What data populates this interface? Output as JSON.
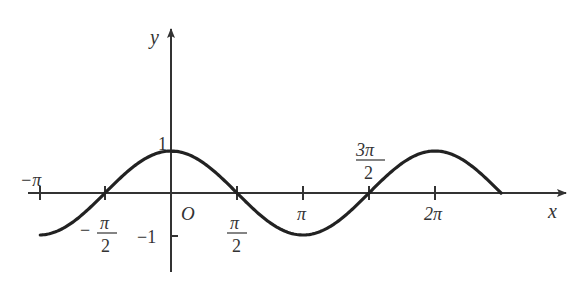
{
  "figure": {
    "axis_labels": {
      "x": "x",
      "y": "y",
      "origin": "O"
    },
    "y_ticks": [
      {
        "value": 1,
        "label": "1"
      },
      {
        "value": -1,
        "label": "−1"
      }
    ],
    "x_ticks": [
      {
        "value": "-pi",
        "label": "−π"
      },
      {
        "value": "-pi/2",
        "numerator": "π",
        "denominator": "2",
        "sign": "−"
      },
      {
        "value": "pi/2",
        "numerator": "π",
        "denominator": "2"
      },
      {
        "value": "pi",
        "label": "π"
      },
      {
        "value": "3pi/2",
        "numerator": "3π",
        "denominator": "2"
      },
      {
        "value": "2pi",
        "label": "2π"
      }
    ],
    "colors": {
      "curve": "#222222",
      "axes": "#333333"
    }
  },
  "chart_data": {
    "type": "line",
    "title": "",
    "function": "y = cos x",
    "xlabel": "x",
    "ylabel": "y",
    "x_domain": [
      "-pi",
      "5pi/2"
    ],
    "ylim": [
      -1,
      1
    ],
    "x": [
      -3.1416,
      -1.5708,
      0,
      1.5708,
      3.1416,
      4.7124,
      6.2832,
      7.854
    ],
    "values": [
      -1,
      0,
      1,
      0,
      -1,
      0,
      1,
      0
    ],
    "grid": false,
    "legend": null
  }
}
